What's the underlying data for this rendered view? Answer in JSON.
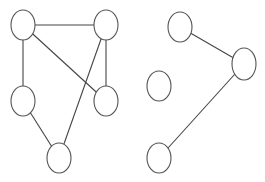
{
  "diagram": {
    "type": "undirected-graph",
    "stroke_color": "#444444",
    "node_fill": "#ffffff",
    "background": "#ffffff",
    "graphs": [
      {
        "name": "left-graph",
        "nodes": [
          {
            "id": "n1",
            "cx": 23,
            "cy": 25,
            "rx": 12,
            "ry": 15
          },
          {
            "id": "n2",
            "cx": 106,
            "cy": 25,
            "rx": 12,
            "ry": 15
          },
          {
            "id": "n3",
            "cx": 23,
            "cy": 101,
            "rx": 12,
            "ry": 15
          },
          {
            "id": "n4",
            "cx": 106,
            "cy": 101,
            "rx": 12,
            "ry": 15
          },
          {
            "id": "n5",
            "cx": 59,
            "cy": 158,
            "rx": 12,
            "ry": 15
          }
        ],
        "edges": [
          [
            "n1",
            "n2"
          ],
          [
            "n1",
            "n3"
          ],
          [
            "n1",
            "n4"
          ],
          [
            "n2",
            "n4"
          ],
          [
            "n2",
            "n5"
          ],
          [
            "n3",
            "n5"
          ]
        ]
      },
      {
        "name": "right-graph",
        "nodes": [
          {
            "id": "n6",
            "cx": 180,
            "cy": 27,
            "rx": 12,
            "ry": 15
          },
          {
            "id": "n7",
            "cx": 244,
            "cy": 64,
            "rx": 12,
            "ry": 16
          },
          {
            "id": "n8",
            "cx": 159,
            "cy": 86,
            "rx": 12,
            "ry": 15
          },
          {
            "id": "n9",
            "cx": 159,
            "cy": 158,
            "rx": 12,
            "ry": 15
          }
        ],
        "edges": [
          [
            "n6",
            "n7"
          ],
          [
            "n7",
            "n9"
          ]
        ]
      }
    ]
  }
}
